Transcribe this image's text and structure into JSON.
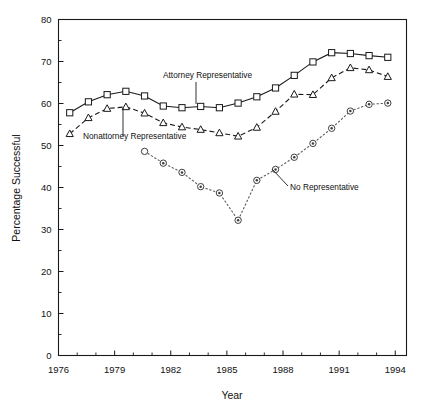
{
  "chart_data": {
    "type": "line",
    "title": "",
    "xlabel": "Year",
    "ylabel": "Percentage Successful",
    "xlim": [
      1976,
      1994.6
    ],
    "ylim": [
      0,
      80
    ],
    "xticks": [
      1976,
      1979,
      1982,
      1985,
      1988,
      1991,
      1994
    ],
    "xtick_labels": [
      "1976",
      "1979",
      "1982",
      "1985",
      "1988",
      "1991",
      "1994"
    ],
    "x_minor_tick_step": 1,
    "yticks": [
      0,
      10,
      20,
      30,
      40,
      50,
      60,
      70,
      80
    ],
    "ytick_labels": [
      "0",
      "10",
      "20",
      "30",
      "40",
      "50",
      "60",
      "70",
      "80"
    ],
    "y_minor_tick_step": 5,
    "grid": false,
    "legend_position": "inline-annotations",
    "series": [
      {
        "name": "Attorney Representative",
        "marker": "square",
        "linestyle": "solid",
        "x": [
          1976.6,
          1977.6,
          1978.6,
          1979.6,
          1980.6,
          1981.6,
          1982.6,
          1983.6,
          1984.6,
          1985.6,
          1986.6,
          1987.6,
          1988.6,
          1989.6,
          1990.6,
          1991.6,
          1992.6,
          1993.6
        ],
        "values": [
          57.8,
          60.4,
          62.1,
          62.9,
          61.8,
          59.4,
          59.0,
          59.3,
          59.0,
          60.1,
          61.6,
          63.7,
          66.7,
          69.9,
          72.1,
          71.9,
          71.4,
          71.0
        ]
      },
      {
        "name": "Nonattorney Representative",
        "marker": "triangle",
        "linestyle": "dashed",
        "x": [
          1976.6,
          1977.6,
          1978.6,
          1979.6,
          1980.6,
          1981.6,
          1982.6,
          1983.6,
          1984.6,
          1985.6,
          1986.6,
          1987.6,
          1988.6,
          1989.6,
          1990.6,
          1991.6,
          1992.6,
          1993.6
        ],
        "values": [
          52.8,
          56.6,
          58.8,
          59.2,
          57.7,
          55.4,
          54.4,
          53.8,
          53.0,
          52.2,
          54.3,
          58.1,
          62.2,
          62.1,
          66.1,
          68.5,
          68.0,
          66.4
        ]
      },
      {
        "name": "No Representative",
        "marker": "circle",
        "linestyle": "dotted",
        "x": [
          1980.6,
          1981.6,
          1982.6,
          1983.6,
          1984.6,
          1985.6,
          1986.6,
          1987.6,
          1988.6,
          1989.6,
          1990.6,
          1991.6,
          1992.6,
          1993.6
        ],
        "values": [
          48.6,
          45.8,
          43.6,
          40.2,
          38.7,
          32.2,
          41.7,
          44.3,
          47.2,
          50.5,
          54.1,
          58.2,
          59.8,
          60.1
        ]
      }
    ],
    "annotations": [
      {
        "text": "Attorney Representative",
        "label_x": 163,
        "label_y": 78,
        "leader": {
          "x1": 196,
          "y1": 82,
          "x2": 196,
          "y2": 104
        }
      },
      {
        "text": "Nonattorney Representative",
        "label_x": 83,
        "label_y": 139,
        "leader": {
          "x1": 123,
          "y1": 136,
          "x2": 123,
          "y2": 108
        }
      },
      {
        "text": "No Representative",
        "label_x": 290,
        "label_y": 190,
        "leader": {
          "x1": 288,
          "y1": 186,
          "x2": 272,
          "y2": 169
        }
      }
    ]
  }
}
